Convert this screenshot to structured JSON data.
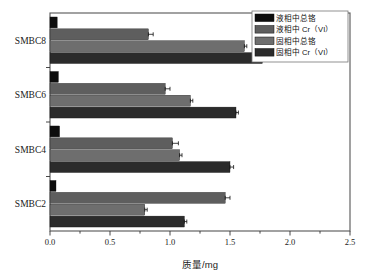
{
  "chart_data": {
    "type": "bar",
    "orientation": "horizontal",
    "title": "",
    "subtitle": "",
    "xlabel": "质量/mg",
    "ylabel": "",
    "xlim": [
      0.0,
      2.5
    ],
    "xticks": [
      "0.0",
      "0.5",
      "1.0",
      "1.5",
      "2.0",
      "2.5"
    ],
    "xtick_values": [
      0.0,
      0.5,
      1.0,
      1.5,
      2.0,
      2.5
    ],
    "minor_ticks": true,
    "grid": false,
    "legend_position": "top-right",
    "categories": [
      "SMBC2",
      "SMBC4",
      "SMBC6",
      "SMBC8"
    ],
    "categories_top_to_bottom": [
      "SMBC8",
      "SMBC6",
      "SMBC4",
      "SMBC2"
    ],
    "series": [
      {
        "name": "液相中总铬",
        "color": "#0d0d0d",
        "values": [
          0.05,
          0.08,
          0.07,
          0.06
        ],
        "errors": [
          0.0,
          0.0,
          0.0,
          0.0
        ]
      },
      {
        "name": "液相中 Cr（VI）",
        "color": "#5e5e5e",
        "values": [
          1.46,
          1.02,
          0.96,
          0.82
        ],
        "errors": [
          0.04,
          0.05,
          0.04,
          0.04
        ]
      },
      {
        "name": "固相中总铬",
        "color": "#6e6e6e",
        "values": [
          0.79,
          1.08,
          1.17,
          1.62
        ],
        "errors": [
          0.02,
          0.02,
          0.02,
          0.02
        ]
      },
      {
        "name": "固相中 Cr（VI）",
        "color": "#2b2b2b",
        "values": [
          1.12,
          1.5,
          1.55,
          1.77
        ],
        "errors": [
          0.02,
          0.03,
          0.02,
          0.02
        ]
      }
    ]
  },
  "legend": {
    "items": [
      {
        "label": "液相中总铬",
        "color": "#0d0d0d"
      },
      {
        "label": "液相中 Cr（VI）",
        "color": "#5e5e5e"
      },
      {
        "label": "固相中总铬",
        "color": "#6e6e6e"
      },
      {
        "label": "固相中 Cr（VI）",
        "color": "#2b2b2b"
      }
    ]
  },
  "axis": {
    "x_title": "质量/mg",
    "x_labels": [
      "0.0",
      "0.5",
      "1.0",
      "1.5",
      "2.0",
      "2.5"
    ],
    "y_labels": [
      "SMBC8",
      "SMBC6",
      "SMBC4",
      "SMBC2"
    ]
  }
}
